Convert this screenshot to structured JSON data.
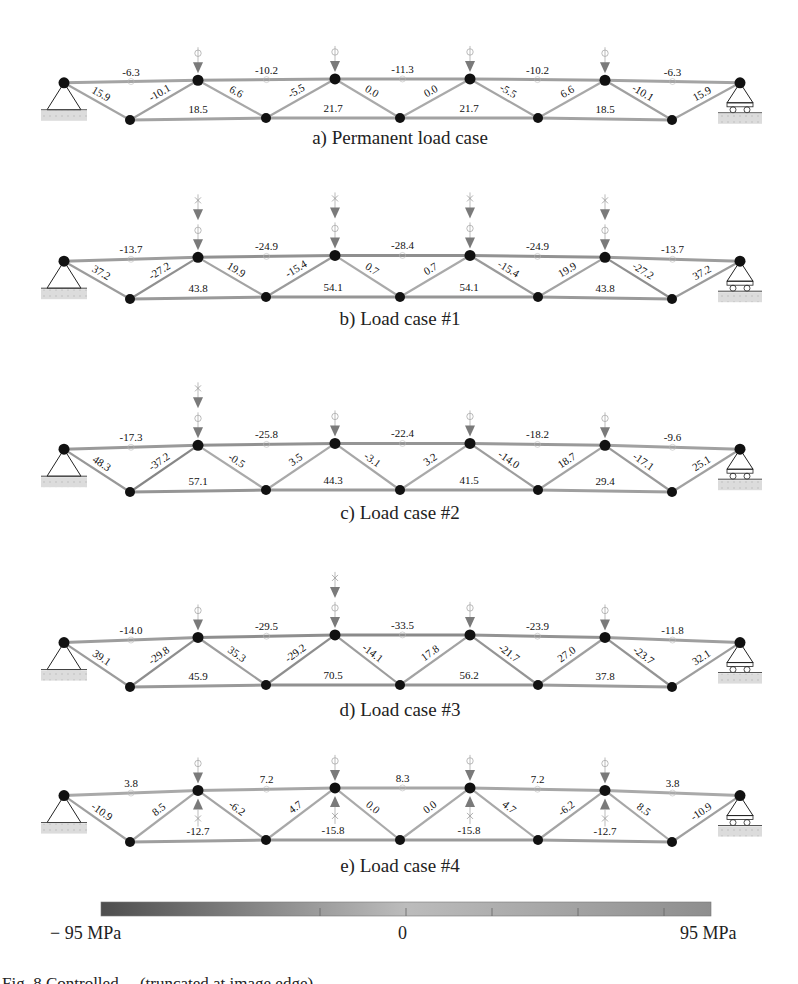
{
  "figure": {
    "colorbar": {
      "min_label": "− 95 MPa",
      "mid_label": "0",
      "max_label": "95 MPa",
      "min_value": -95,
      "max_value": 95,
      "unit": "MPa",
      "colors": {
        "negative": "#5a5a5a",
        "zero": "#b0b0b0",
        "positive": "#9a9a9a"
      }
    },
    "caption_partial": "Fig. 8  Controlled ... (truncated at image edge)",
    "colors": {
      "node": "#111111",
      "member": "#9c9c9c",
      "load_arrow": "#7a7a7a",
      "ground": "#d8d8d8"
    }
  },
  "chart_data": {
    "type": "truss-stress-diagram",
    "unit": "MPa",
    "member_order": [
      "top1",
      "top2",
      "top3",
      "top4",
      "top5",
      "top6",
      "diag1",
      "diag2",
      "diag3",
      "diag4",
      "diag5",
      "diag6",
      "diag7",
      "diag8",
      "diag9",
      "diag10",
      "diag11",
      "diag12",
      "bot1",
      "bot2",
      "bot3",
      "bot4"
    ],
    "panels": [
      {
        "id": "a",
        "caption": "a) Permanent load case",
        "loads_down_permanent": [
          1,
          2,
          3,
          4
        ],
        "loads_down_variable": [],
        "loads_up_variable": [],
        "top": [
          "-6.3",
          "-10.2",
          "-11.3",
          "-10.2",
          "-6.3"
        ],
        "top_mid_extra": [],
        "diagonals": [
          "15.9",
          "-10.1",
          "6.6",
          "-5.5",
          "0.0",
          "0.0",
          "-5.5",
          "6.6",
          "-10.1",
          "15.9"
        ],
        "bottom": [
          "18.5",
          "21.7",
          "21.7",
          "18.5"
        ]
      },
      {
        "id": "b",
        "caption": "b) Load case #1",
        "loads_down_permanent": [
          1,
          2,
          3,
          4
        ],
        "loads_down_variable": [
          1,
          2,
          3,
          4
        ],
        "loads_up_variable": [],
        "top": [
          "-13.7",
          "-24.9",
          "-28.4",
          "-24.9",
          "-13.7"
        ],
        "diagonals": [
          "37.2",
          "-27.2",
          "19.9",
          "-15.4",
          "0.7",
          "0.7",
          "-15.4",
          "19.9",
          "-27.2",
          "37.2"
        ],
        "bottom": [
          "43.8",
          "54.1",
          "54.1",
          "43.8"
        ]
      },
      {
        "id": "c",
        "caption": "c) Load case #2",
        "loads_down_permanent": [
          1,
          2,
          3,
          4
        ],
        "loads_down_variable": [
          1
        ],
        "loads_up_variable": [],
        "top": [
          "-17.3",
          "-25.8",
          "-22.4",
          "-18.2",
          "-9.6"
        ],
        "diagonals": [
          "48.3",
          "-37.2",
          "-0.5",
          "3.5",
          "-3.1",
          "3.2",
          "-14.0",
          "18.7",
          "-17.1",
          "25.1"
        ],
        "bottom": [
          "57.1",
          "44.3",
          "41.5",
          "29.4"
        ]
      },
      {
        "id": "d",
        "caption": "d) Load case #3",
        "loads_down_permanent": [
          1,
          2,
          3,
          4
        ],
        "loads_down_variable": [
          2
        ],
        "loads_up_variable": [],
        "top": [
          "-14.0",
          "-29.5",
          "-33.5",
          "-23.9",
          "-11.8"
        ],
        "diagonals": [
          "39.1",
          "-29.8",
          "35.3",
          "-29.2",
          "-14.1",
          "17.8",
          "-21.7",
          "27.0",
          "-23.7",
          "32.1"
        ],
        "bottom": [
          "45.9",
          "70.5",
          "56.2",
          "37.8"
        ]
      },
      {
        "id": "e",
        "caption": "e) Load case #4",
        "loads_down_permanent": [
          1,
          2,
          3,
          4
        ],
        "loads_down_variable": [],
        "loads_up_variable": [
          1,
          2,
          3,
          4
        ],
        "top": [
          "3.8",
          "7.2",
          "8.3",
          "7.2",
          "3.8"
        ],
        "diagonals": [
          "-10.9",
          "8.5",
          "-6.2",
          "4.7",
          "0.0",
          "0.0",
          "4.7",
          "-6.2",
          "8.5",
          "-10.9"
        ],
        "bottom": [
          "-12.7",
          "-15.8",
          "-15.8",
          "-12.7"
        ]
      }
    ]
  }
}
